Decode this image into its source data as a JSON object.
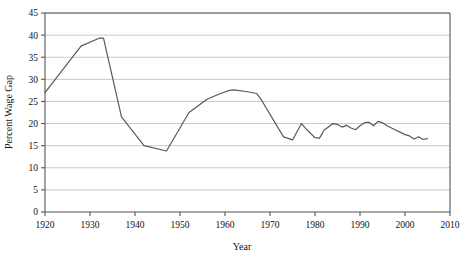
{
  "chart_data": {
    "type": "line",
    "title": "",
    "xlabel": "Year",
    "ylabel": "Percent Wage Gap",
    "xlim": [
      1920,
      2010
    ],
    "ylim": [
      0,
      45
    ],
    "xticks": [
      1920,
      1930,
      1940,
      1950,
      1960,
      1970,
      1980,
      1990,
      2000,
      2010
    ],
    "yticks": [
      0,
      5,
      10,
      15,
      20,
      25,
      30,
      35,
      40,
      45
    ],
    "xtick_labels": [
      "1920",
      "1930",
      "1940",
      "1950",
      "1960",
      "1970",
      "1980",
      "1990",
      "2000",
      "2010"
    ],
    "ytick_labels": [
      "0",
      "5",
      "10",
      "15",
      "20",
      "25",
      "30",
      "35",
      "40",
      "45"
    ],
    "grid": "horizontal",
    "legend": "none",
    "line_color": "#595959",
    "grid_color": "#c8c8c8",
    "axis_color": "#555555",
    "series": [
      {
        "name": "Percent Wage Gap",
        "x": [
          1920,
          1928,
          1932,
          1933,
          1937,
          1942,
          1947,
          1952,
          1956,
          1959,
          1961,
          1962,
          1965,
          1967,
          1968,
          1973,
          1975,
          1977,
          1978,
          1980,
          1981,
          1982,
          1984,
          1985,
          1986,
          1987,
          1988,
          1989,
          1990,
          1991,
          1992,
          1993,
          1994,
          1995,
          1996,
          1997,
          1998,
          1999,
          2000,
          2001,
          2002,
          2003,
          2004,
          2005
        ],
        "y": [
          27.0,
          37.5,
          39.3,
          39.3,
          21.5,
          15.0,
          13.8,
          22.5,
          25.5,
          26.8,
          27.5,
          27.6,
          27.2,
          26.8,
          25.5,
          17.0,
          16.3,
          20.0,
          18.8,
          16.8,
          16.7,
          18.5,
          20.0,
          19.8,
          19.2,
          19.6,
          19.0,
          18.6,
          19.5,
          20.2,
          20.3,
          19.5,
          20.5,
          20.2,
          19.5,
          19.0,
          18.5,
          18.0,
          17.5,
          17.2,
          16.5,
          17.0,
          16.4,
          16.6
        ]
      }
    ]
  }
}
